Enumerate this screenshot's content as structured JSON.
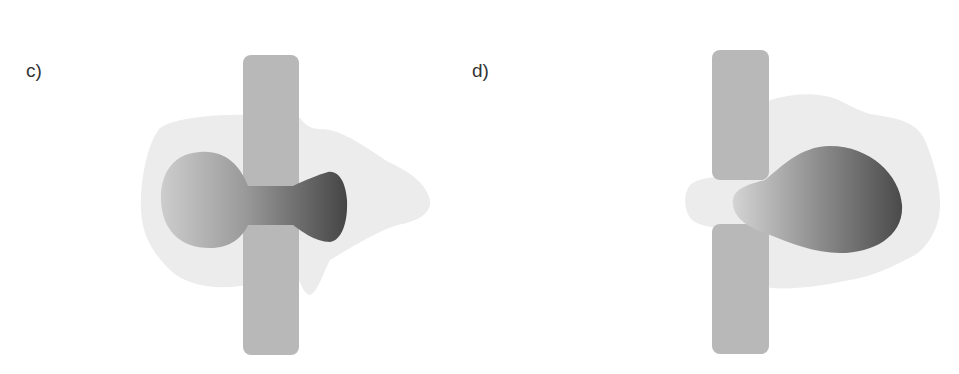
{
  "panels": [
    {
      "id": "c",
      "label": "c)",
      "description": "Continuous membrane bar with dumbbell-shaped dark body passing through; light halo behind"
    },
    {
      "id": "d",
      "label": "d)",
      "description": "Membrane bar split into two segments with a gap; egg-shaped dark body on right; light halo behind"
    }
  ],
  "colors": {
    "background": "#ffffff",
    "halo": "#ececec",
    "bar": "#b8b8b8",
    "body_light": "#c4c4c4",
    "body_dark": "#4a4a4a",
    "label": "#333333"
  }
}
